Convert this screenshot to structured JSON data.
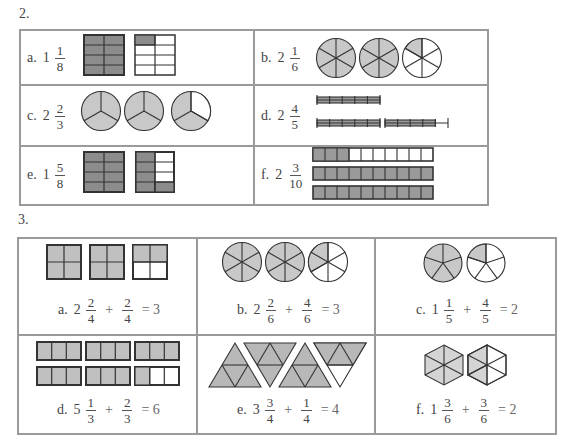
{
  "colors": {
    "shade_dark": "#8c8c8c",
    "shade_light": "#c8c8c8",
    "line": "#333333",
    "border": "#9a9a9a"
  },
  "problem2": {
    "number": "2.",
    "items": [
      {
        "letter": "a.",
        "whole": "1",
        "num": "1",
        "den": "8",
        "model": "rectangle-8-parts",
        "full_units": 1,
        "partial_shaded": 1,
        "parts": 8
      },
      {
        "letter": "b.",
        "whole": "2",
        "num": "1",
        "den": "6",
        "model": "circle-6-parts",
        "full_units": 2,
        "partial_shaded": 1,
        "parts": 6
      },
      {
        "letter": "c.",
        "whole": "2",
        "num": "2",
        "den": "3",
        "model": "circle-3-parts",
        "full_units": 2,
        "partial_shaded": 2,
        "parts": 3
      },
      {
        "letter": "d.",
        "whole": "2",
        "num": "4",
        "den": "5",
        "model": "bar-5-parts",
        "full_units": 2,
        "partial_shaded": 4,
        "parts": 5
      },
      {
        "letter": "e.",
        "whole": "1",
        "num": "5",
        "den": "8",
        "model": "rectangle-8-parts",
        "full_units": 1,
        "partial_shaded": 5,
        "parts": 8
      },
      {
        "letter": "f.",
        "whole": "2",
        "num": "3",
        "den": "10",
        "model": "strip-10-parts",
        "full_units": 2,
        "partial_shaded": 3,
        "parts": 10
      }
    ]
  },
  "problem3": {
    "number": "3.",
    "items": [
      {
        "letter": "a.",
        "whole": "2",
        "num1": "2",
        "den1": "4",
        "plus": "+",
        "num2": "2",
        "den2": "4",
        "equals": "= 3",
        "model": "square-4-parts"
      },
      {
        "letter": "b.",
        "whole": "2",
        "num1": "2",
        "den1": "6",
        "plus": "+",
        "num2": "4",
        "den2": "6",
        "equals": "= 3",
        "model": "circle-6-parts"
      },
      {
        "letter": "c.",
        "whole": "1",
        "num1": "1",
        "den1": "5",
        "plus": "+",
        "num2": "4",
        "den2": "5",
        "equals": "= 2",
        "model": "circle-5-parts"
      },
      {
        "letter": "d.",
        "whole": "5",
        "num1": "1",
        "den1": "3",
        "plus": "+",
        "num2": "2",
        "den2": "3",
        "equals": "= 6",
        "model": "rectangle-3-parts"
      },
      {
        "letter": "e.",
        "whole": "3",
        "num1": "3",
        "den1": "4",
        "plus": "+",
        "num2": "1",
        "den2": "4",
        "equals": "= 4",
        "model": "triangle-4-parts"
      },
      {
        "letter": "f.",
        "whole": "1",
        "num1": "3",
        "den1": "6",
        "plus": "+",
        "num2": "3",
        "den2": "6",
        "equals": "= 2",
        "model": "hexagon-6-parts"
      }
    ]
  }
}
